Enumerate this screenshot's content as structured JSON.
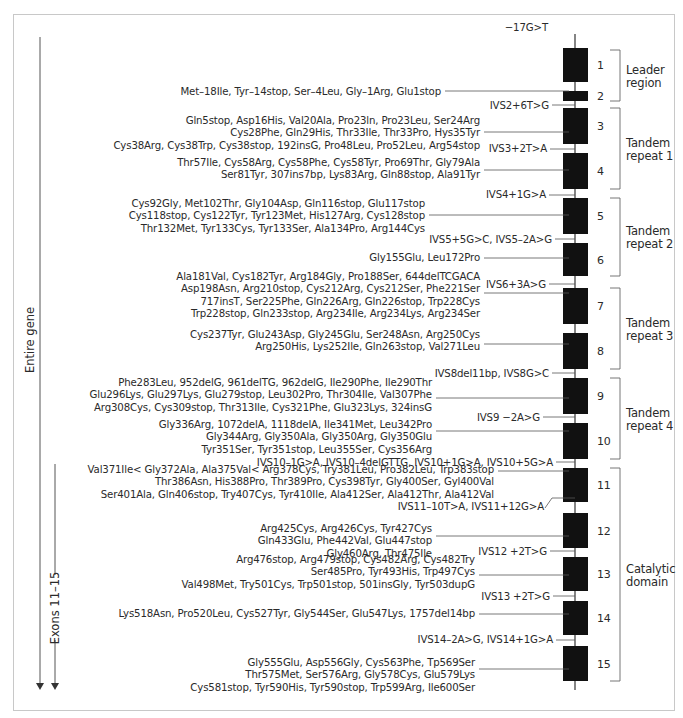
{
  "left_labels": {
    "entire_gene": "Entire gene",
    "exons_11_15": "Exons 11–15"
  },
  "exons": [
    "1",
    "2",
    "3",
    "4",
    "5",
    "6",
    "7",
    "8",
    "9",
    "10",
    "11",
    "12",
    "13",
    "14",
    "15"
  ],
  "regions": [
    {
      "label_lines": [
        "Leader",
        "region"
      ]
    },
    {
      "label_lines": [
        "Tandem",
        "repeat 1"
      ]
    },
    {
      "label_lines": [
        "Tandem",
        "repeat 2"
      ]
    },
    {
      "label_lines": [
        "Tandem",
        "repeat 3"
      ]
    },
    {
      "label_lines": [
        "Tandem",
        "repeat 4"
      ]
    },
    {
      "label_lines": [
        "Catalytic",
        "domain"
      ]
    }
  ],
  "upstream_mutation": "−17G>T",
  "exon_mutations": [
    {
      "exon": "2",
      "lines": [
        "Met–18Ile, Tyr–14stop, Ser–4Leu, Gly–1Arg, Glu1stop"
      ]
    },
    {
      "exon": "3",
      "lines": [
        "Gln5stop, Asp16His, Val20Ala, Pro23ln, Pro23Leu, Ser24Arg",
        "Cys28Phe, Gln29His, Thr33Ile, Thr33Pro, Hys35Tyr",
        "Cys38Arg, Cys38Trp, Cys38stop, 192insG, Pro48Leu, Pro52Leu, Arg54stop"
      ]
    },
    {
      "exon": "4",
      "lines": [
        "Thr57Ile, Cys58Arg, Cys58Phe, Cys58Tyr, Pro69Thr, Gly79Ala",
        "Ser81Tyr, 307ins7bp, Lys83Arg, Gln88stop, Ala91Tyr"
      ]
    },
    {
      "exon": "5",
      "lines": [
        "Cys92Gly, Met102Thr, Gly104Asp, Gln116stop, Glu117stop",
        "Cys118stop, Cys122Tyr, Tyr123Met, His127Arg, Cys128stop",
        "Thr132Met, Tyr133Cys, Tyr133Ser, Ala134Pro, Arg144Cys"
      ]
    },
    {
      "exon": "6",
      "lines": [
        "Gly155Glu, Leu172Pro"
      ]
    },
    {
      "exon": "7",
      "lines": [
        "Ala181Val, Cys182Tyr, Arg184Gly, Pro188Ser, 644delTCGACA",
        "Asp198Asn, Arg210stop, Cys212Arg, Cys212Ser, Phe221Ser",
        "717insT, Ser225Phe, Gln226Arg, Gln226stop, Trp228Cys",
        "Trp228stop, Gln233stop, Arg234Ile, Arg234Lys, Arg234Ser"
      ]
    },
    {
      "exon": "8",
      "lines": [
        "Cys237Tyr, Glu243Asp, Gly245Glu, Ser248Asn, Arg250Cys",
        "Arg250His, Lys252Ile, Gln263stop, Val271Leu"
      ]
    },
    {
      "exon": "9",
      "lines": [
        "Phe283Leu, 952delG, 961delTG, 962delG, Ile290Phe, Ile290Thr",
        "Glu296Lys, Glu297Lys, Glu279stop, Leu302Pro, Thr304Ile, Val307Phe",
        "Arg308Cys, Cys309stop, Thr313Ile, Cys321Phe, Glu323Lys, 324insG"
      ]
    },
    {
      "exon": "10",
      "lines": [
        "Gly336Arg, 1072delA, 1118delA, Ile341Met, Leu342Pro",
        "Gly344Arg, Gly350Ala, Gly350Arg, Gly350Glu",
        "Tyr351Ser, Tyr351stop, Leu355Ser, Cys356Arg"
      ]
    },
    {
      "exon": "11",
      "lines": [
        "Val371Ile< Gly372Ala, Ala375Val< Arg378Cys, Try381Leu, Pro382Leu, Trp383stop",
        "Thr386Asn, His388Pro, Thr389Pro, Cys398Tyr, Gly400Ser, Gyl400Val",
        "Ser401Ala, Gln406stop, Try407Cys, Tyr410Ile, Ala412Ser, Ala412Thr, Ala412Val"
      ]
    },
    {
      "exon": "12",
      "lines": [
        "Arg425Cys, Arg426Cys, Tyr427Cys",
        "Gln433Glu, Phe442Val, Glu447stop",
        "Gly460Arg, Thr475Ile"
      ]
    },
    {
      "exon": "13",
      "lines": [
        "Arg476stop, Arg479stop, Cys482Arg, Cys482Try",
        "Ser485Pro, Tyr493His, Trp497Cys",
        "Val498Met, Try501Cys, Trp501stop, 501insGly, Tyr503dupG"
      ]
    },
    {
      "exon": "14",
      "lines": [
        "Lys518Asn, Pro520Leu, Cys527Tyr, Gly544Ser, Glu547Lys, 1757del14bp"
      ]
    },
    {
      "exon": "15",
      "lines": [
        "Gly555Glu, Asp556Gly, Cys563Phe, Tp569Ser",
        "Thr575Met, Ser576Arg, Gly578Cys, Glu579Lys",
        "Cys581stop, Tyr590His, Tyr590stop, Trp599Arg, Ile600Ser"
      ]
    }
  ],
  "intron_mutations": [
    {
      "intron": "2",
      "label": "IVS2+6T>G"
    },
    {
      "intron": "3",
      "label": "IVS3+2T>A"
    },
    {
      "intron": "4",
      "label": "IVS4+1G>A"
    },
    {
      "intron": "5",
      "label": "IVS5+5G>C, IVS5–2A>G"
    },
    {
      "intron": "6",
      "label": "IVS6+3A>G"
    },
    {
      "intron": "8",
      "label": "IVS8del11bp, IVS8G>C"
    },
    {
      "intron": "9",
      "label": "IVS9 −2A>G"
    },
    {
      "intron": "10",
      "label": "IVS10–1G>A, IVS10–4delGTTG, IVS10+1G>A, IVS10+5G>A"
    },
    {
      "intron": "11",
      "label": "IVS11–10T>A, IVS11+12G>A"
    },
    {
      "intron": "12",
      "label": "IVS12 +2T>G"
    },
    {
      "intron": "13",
      "label": "IVS13 +2T>G"
    },
    {
      "intron": "14",
      "label": "IVS14–2A>G, IVS14+1G>A"
    }
  ]
}
